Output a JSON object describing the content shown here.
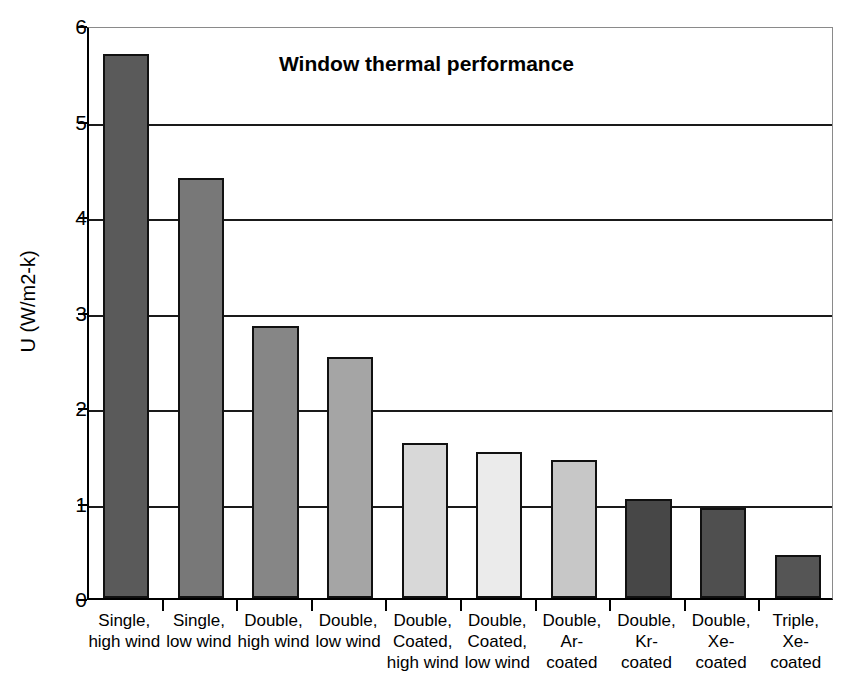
{
  "chart_data": {
    "type": "bar",
    "title": "Window thermal performance",
    "xlabel": "",
    "ylabel": "U (W/m2-k)",
    "ylim": [
      0,
      6
    ],
    "yticks": [
      0,
      1,
      2,
      3,
      4,
      5,
      6
    ],
    "ytick_labels": [
      "0",
      "1",
      "2",
      "3",
      "4",
      "5",
      "6"
    ],
    "grid": true,
    "legend": null,
    "categories": [
      "Single, high wind",
      "Single, low wind",
      "Double, high wind",
      "Double, low wind",
      "Double, Coated, high wind",
      "Double, Coated, low wind",
      "Double, Ar-coated",
      "Double, Kr-coated",
      "Double, Xe-coated",
      "Triple, Xe-coated"
    ],
    "category_lines": [
      [
        "Single,",
        "high wind"
      ],
      [
        "Single,",
        "low wind"
      ],
      [
        "Double,",
        "high wind"
      ],
      [
        "Double,",
        "low wind"
      ],
      [
        "Double,",
        "Coated,",
        "high wind"
      ],
      [
        "Double,",
        "Coated,",
        "low wind"
      ],
      [
        "Double,",
        "Ar-",
        "coated"
      ],
      [
        "Double,",
        "Kr-",
        "coated"
      ],
      [
        "Double,",
        "Xe-",
        "coated"
      ],
      [
        "Triple,",
        "Xe-",
        "coated"
      ]
    ],
    "values": [
      5.7,
      4.4,
      2.85,
      2.52,
      1.62,
      1.53,
      1.44,
      1.04,
      0.94,
      0.45
    ],
    "bar_colors": [
      "#5a5a5a",
      "#787878",
      "#868686",
      "#a5a5a5",
      "#d8d8d8",
      "#ebebeb",
      "#c7c7c7",
      "#474747",
      "#4f4f4f",
      "#555555"
    ],
    "bar_edge_color": "#111111",
    "background_color": "#ffffff",
    "text_color": "#000000"
  }
}
